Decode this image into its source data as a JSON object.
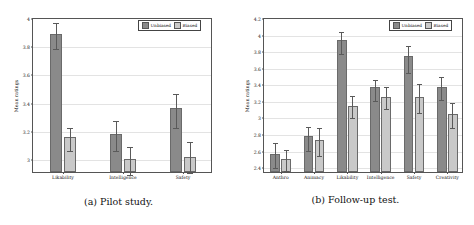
{
  "figure": {
    "subfigures": [
      {
        "key": "pilot",
        "caption": "(a) Pilot study.",
        "legend": {
          "unbiased": "Unbiased",
          "biased": "Biased"
        },
        "chart_data": {
          "type": "bar",
          "title": "",
          "xlabel": "",
          "ylabel": "Mean ratings",
          "ylim": [
            2.9,
            4.0
          ],
          "yticks": [
            "3",
            "3.2",
            "3.4",
            "3.6",
            "3.8",
            "4"
          ],
          "ytick_values": [
            3,
            3.2,
            3.4,
            3.6,
            3.8,
            4
          ],
          "grid": true,
          "legend_position": "top-right",
          "categories": [
            "Likability",
            "Intelligence",
            "Safety"
          ],
          "series": [
            {
              "name": "Unbiased",
              "color": "#8a8a8a",
              "values": [
                3.88,
                3.17,
                3.355
              ],
              "err_low": [
                3.785,
                3.065,
                3.225
              ],
              "err_high": [
                3.975,
                3.275,
                3.47
              ]
            },
            {
              "name": "Biased",
              "color": "#c9c9c9",
              "values": [
                3.15,
                2.99,
                3.01
              ],
              "err_low": [
                3.06,
                2.895,
                2.905
              ],
              "err_high": [
                3.225,
                3.09,
                3.125
              ]
            }
          ]
        }
      },
      {
        "key": "followup",
        "caption": "(b) Follow-up test.",
        "legend": {
          "unbiased": "Unbiased",
          "biased": "Biased"
        },
        "chart_data": {
          "type": "bar",
          "title": "",
          "xlabel": "",
          "ylabel": "Mean ratings",
          "ylim": [
            2.33,
            4.2
          ],
          "yticks": [
            "2.4",
            "2.6",
            "2.8",
            "3",
            "3.2",
            "3.4",
            "3.6",
            "3.8",
            "4",
            "4.2"
          ],
          "ytick_values": [
            2.4,
            2.6,
            2.8,
            3,
            3.2,
            3.4,
            3.6,
            3.8,
            4,
            4.2
          ],
          "grid": true,
          "legend_position": "top-right",
          "categories": [
            "Anthro",
            "Animacy",
            "Likability",
            "Intelligence",
            "Safety",
            "Creativity"
          ],
          "series": [
            {
              "name": "Unbiased",
              "color": "#8a8a8a",
              "values": [
                2.55,
                2.77,
                3.92,
                3.35,
                3.73,
                3.36
              ],
              "err_low": [
                2.4,
                2.61,
                3.78,
                3.21,
                3.55,
                3.22
              ],
              "err_high": [
                2.71,
                2.9,
                4.04,
                3.47,
                3.87,
                3.5
              ]
            },
            {
              "name": "Biased",
              "color": "#c9c9c9",
              "values": [
                2.49,
                2.72,
                3.13,
                3.24,
                3.24,
                3.03
              ],
              "err_low": [
                2.37,
                2.55,
                3.0,
                3.11,
                3.06,
                2.88
              ],
              "err_high": [
                2.62,
                2.89,
                3.27,
                3.38,
                3.42,
                3.19
              ]
            }
          ]
        }
      }
    ]
  }
}
